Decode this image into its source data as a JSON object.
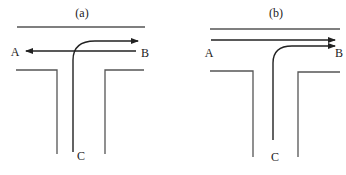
{
  "panels": [
    {
      "id": "a",
      "title": "(a)",
      "labels": {
        "left": "A",
        "right": "B",
        "bottom": "C"
      },
      "description": "Conflicting flows: A-B two-way through traffic with C turning right into B direction"
    },
    {
      "id": "b",
      "title": "(b)",
      "labels": {
        "left": "A",
        "right": "B",
        "bottom": "C"
      },
      "description": "Merging flows: A to B through traffic and C turning right to B, both one-way"
    }
  ],
  "colors": {
    "road": "#555555",
    "flow": "#222222",
    "background": "#ffffff"
  }
}
